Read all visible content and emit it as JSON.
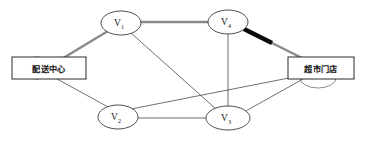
{
  "diagram": {
    "type": "network-graph",
    "title": "",
    "background_color": "#ffffff",
    "colors": {
      "edge_thin": "#4a4a4a",
      "edge_highlight": "#8a8a8a",
      "edge_bold": "#0a0a0a",
      "node_stroke": "#3a3a3a",
      "node_fill": "#ffffff",
      "box_stroke": "#2b2b2b",
      "box_fill": "#ffffff",
      "text": "#111111"
    },
    "nodes": [
      {
        "id": "dc",
        "label": "配送中心",
        "shape": "rect",
        "cx": 49,
        "cy": 68,
        "rx": 37,
        "ry": 11
      },
      {
        "id": "v1",
        "label": "V",
        "sub": "1",
        "shape": "ellipse",
        "cx": 121,
        "cy": 23,
        "rx": 20,
        "ry": 12
      },
      {
        "id": "v4",
        "label": "V",
        "sub": "4",
        "shape": "ellipse",
        "cx": 228,
        "cy": 22,
        "rx": 20,
        "ry": 12
      },
      {
        "id": "v2",
        "label": "V",
        "sub": "2",
        "shape": "ellipse",
        "cx": 118,
        "cy": 117,
        "rx": 20,
        "ry": 12
      },
      {
        "id": "v3",
        "label": "V",
        "sub": "3",
        "shape": "ellipse",
        "cx": 228,
        "cy": 118,
        "rx": 22,
        "ry": 12
      },
      {
        "id": "store",
        "label": "超市门店",
        "shape": "rect",
        "cx": 320,
        "cy": 68,
        "rx": 33,
        "ry": 11
      }
    ],
    "ghost_ellipses": [
      {
        "at": "dc",
        "cx": 37,
        "cy": 68,
        "rx": 18,
        "ry": 11
      },
      {
        "at": "store",
        "cx": 318,
        "cy": 78,
        "rx": 18,
        "ry": 10
      }
    ],
    "edges": [
      {
        "from": "dc",
        "to": "v1",
        "style": "highlight"
      },
      {
        "from": "v1",
        "to": "v4",
        "style": "highlight"
      },
      {
        "from": "v4",
        "to": "store",
        "style": "bold-then-highlight"
      },
      {
        "from": "dc",
        "to": "v2",
        "style": "thin"
      },
      {
        "from": "v1",
        "to": "v3",
        "style": "thin"
      },
      {
        "from": "v2",
        "to": "v3",
        "style": "thin"
      },
      {
        "from": "v4",
        "to": "v3",
        "style": "thin"
      },
      {
        "from": "v2",
        "to": "store",
        "style": "thin"
      },
      {
        "from": "v3",
        "to": "store",
        "style": "thin"
      }
    ],
    "highlighted_path": [
      "配送中心",
      "V1",
      "V4",
      "超市门店"
    ]
  }
}
